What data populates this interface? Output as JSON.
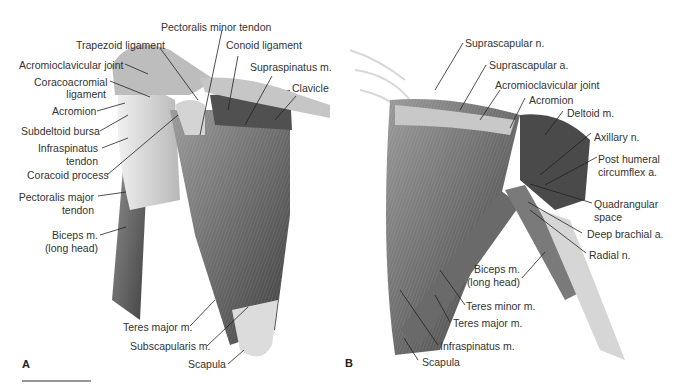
{
  "figure": {
    "panels": [
      {
        "id": "A",
        "letter": "A",
        "labels": {
          "pectoralis_minor_tendon": "Pectoralis minor tendon",
          "trapezoid_ligament": "Trapezoid ligament",
          "conoid_ligament": "Conoid ligament",
          "acromioclavicular_joint": "Acromioclavicular joint",
          "supraspinatus": "Supraspinatus m.",
          "coracoacromial_ligament_1": "Coracoacromial",
          "coracoacromial_ligament_2": "ligament",
          "clavicle": "Clavicle",
          "acromion": "Acromion",
          "subdeltoid_bursa": "Subdeltoid bursa",
          "infraspinatus_tendon_1": "Infraspinatus",
          "infraspinatus_tendon_2": "tendon",
          "coracoid_process": "Coracoid process",
          "pectoralis_major_tendon_1": "Pectoralis major",
          "pectoralis_major_tendon_2": "tendon",
          "biceps_1": "Biceps m.",
          "biceps_2": "(long head)",
          "teres_major": "Teres major m.",
          "subscapularis": "Subscapularis m.",
          "scapula": "Scapula"
        }
      },
      {
        "id": "B",
        "letter": "B",
        "labels": {
          "suprascapular_n": "Suprascapular n.",
          "suprascapular_a": "Suprascapular a.",
          "acromioclavicular_joint": "Acromioclavicular joint",
          "acromion": "Acromion",
          "deltoid": "Deltoid m.",
          "axillary_n": "Axillary n.",
          "post_humeral_1": "Post humeral",
          "post_humeral_2": "circumflex a.",
          "quadrangular_1": "Quadrangular",
          "quadrangular_2": "space",
          "deep_brachial": "Deep brachial a.",
          "radial_n": "Radial n.",
          "biceps_1": "Biceps m.",
          "biceps_2": "(long head)",
          "teres_minor": "Teres minor m.",
          "teres_major": "Teres major m.",
          "infraspinatus": "Infraspinatus m.",
          "scapula": "Scapula"
        }
      }
    ],
    "colors": {
      "muscle_dark": "#5a5a5a",
      "muscle_mid": "#8a8a8a",
      "bone": "#d8d8d8",
      "leader": "#222222",
      "text": "#333333"
    }
  }
}
